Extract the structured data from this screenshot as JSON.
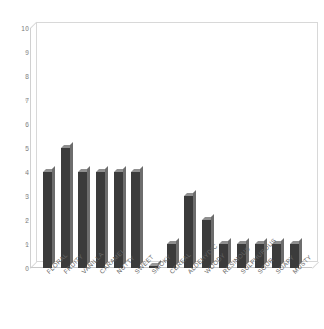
{
  "chart_data": {
    "type": "bar",
    "title": "",
    "subtitle": "",
    "xlabel": "",
    "ylabel": "",
    "ylim": [
      0,
      10
    ],
    "y_ticks": [
      0,
      1,
      2,
      3,
      4,
      5,
      6,
      7,
      8,
      9,
      10
    ],
    "grid": false,
    "legend": false,
    "bar_color": "#3b3b3b",
    "frame_color": "#d8d8d8",
    "categories": [
      "FLORAL",
      "FRUITY",
      "VANILLA",
      "CARAMEL",
      "NUTTY",
      "SWEET",
      "SMOKY",
      "CEREAL",
      "ALDEHYDIC",
      "WOODY",
      "RESINOUS",
      "SULPHUROUS",
      "SOUR",
      "SOAPY",
      "MUSTY"
    ],
    "values": [
      4,
      5,
      4,
      4,
      4,
      4,
      0,
      1,
      3,
      2,
      1,
      1,
      1,
      1,
      1
    ]
  }
}
